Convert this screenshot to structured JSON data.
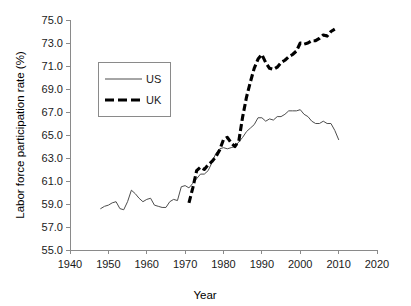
{
  "chart_data": {
    "type": "line",
    "title": "",
    "xlabel": "Year",
    "ylabel": "Labor force participation rate (%)",
    "xlim": [
      1940,
      2020
    ],
    "ylim": [
      55.0,
      75.0
    ],
    "grid": false,
    "legend_position": "upper-left-inside",
    "xticks": [
      "1940",
      "1950",
      "1960",
      "1970",
      "1980",
      "1990",
      "2000",
      "2010",
      "2020"
    ],
    "yticks": [
      "55.0",
      "57.0",
      "59.0",
      "61.0",
      "63.0",
      "65.0",
      "67.0",
      "69.0",
      "71.0",
      "73.0",
      "75.0"
    ],
    "series": [
      {
        "name": "US",
        "style": "thin-solid",
        "color": "#4d4d4d",
        "x": [
          1948,
          1949,
          1950,
          1951,
          1952,
          1953,
          1954,
          1955,
          1956,
          1957,
          1958,
          1959,
          1960,
          1961,
          1962,
          1963,
          1964,
          1965,
          1966,
          1967,
          1968,
          1969,
          1970,
          1971,
          1972,
          1973,
          1974,
          1975,
          1976,
          1977,
          1978,
          1979,
          1980,
          1981,
          1982,
          1983,
          1984,
          1985,
          1986,
          1987,
          1988,
          1989,
          1990,
          1991,
          1992,
          1993,
          1994,
          1995,
          1996,
          1997,
          1998,
          1999,
          2000,
          2001,
          2002,
          2003,
          2004,
          2005,
          2006,
          2007,
          2008,
          2009,
          2010
        ],
        "y": [
          58.6,
          58.8,
          58.9,
          59.1,
          59.2,
          58.6,
          58.5,
          59.2,
          60.2,
          59.9,
          59.5,
          59.2,
          59.4,
          59.5,
          58.9,
          58.8,
          58.7,
          58.7,
          59.2,
          59.4,
          59.3,
          60.5,
          60.6,
          60.4,
          60.8,
          61.2,
          61.6,
          61.6,
          61.9,
          62.6,
          63.4,
          63.8,
          63.9,
          63.8,
          63.9,
          64.0,
          64.4,
          64.8,
          65.3,
          65.6,
          65.9,
          66.5,
          66.5,
          66.2,
          66.4,
          66.3,
          66.6,
          66.6,
          66.8,
          67.1,
          67.1,
          67.1,
          67.2,
          66.8,
          66.6,
          66.2,
          66.0,
          66.0,
          66.2,
          66.0,
          66.0,
          65.4,
          64.6
        ]
      },
      {
        "name": "UK",
        "style": "thick-dashed",
        "color": "#000000",
        "x": [
          1971,
          1972,
          1973,
          1974,
          1975,
          1976,
          1977,
          1978,
          1979,
          1980,
          1981,
          1982,
          1983,
          1984,
          1985,
          1986,
          1987,
          1988,
          1989,
          1990,
          1991,
          1992,
          1993,
          1994,
          1995,
          1996,
          1997,
          1998,
          1999,
          2000,
          2001,
          2002,
          2003,
          2004,
          2005,
          2006,
          2007,
          2008,
          2009
        ],
        "y": [
          59.1,
          60.4,
          61.9,
          62.2,
          62.0,
          62.4,
          62.7,
          63.1,
          63.7,
          64.6,
          64.8,
          64.3,
          64.0,
          64.5,
          66.6,
          68.3,
          69.6,
          70.8,
          71.6,
          72.0,
          71.3,
          70.8,
          70.7,
          70.9,
          71.3,
          71.5,
          71.8,
          72.0,
          72.3,
          73.0,
          72.9,
          73.0,
          73.2,
          73.2,
          73.4,
          73.7,
          73.6,
          74.0,
          74.2
        ]
      }
    ]
  },
  "legend": {
    "entries": [
      {
        "label": "US"
      },
      {
        "label": "UK"
      }
    ]
  }
}
